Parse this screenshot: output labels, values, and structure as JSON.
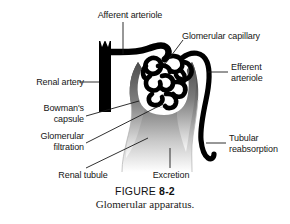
{
  "figure": {
    "number_prefix": "FIGURE",
    "number": "8-2",
    "title": "Glomerular apparatus."
  },
  "labels": {
    "afferent_arteriole": "Afferent arteriole",
    "glomerular_capillary": "Glomerular capillary",
    "efferent_arteriole_line1": "Efferent",
    "efferent_arteriole_line2": "arteriole",
    "renal_artery": "Renal artery",
    "bowmans_capsule_line1": "Bowman's",
    "bowmans_capsule_line2": "capsule",
    "glomerular_filtration_line1": "Glomerular",
    "glomerular_filtration_line2": "filtration",
    "renal_tubule": "Renal tubule",
    "excretion": "Excretion",
    "tubular_reabsorption_line1": "Tubular",
    "tubular_reabsorption_line2": "reabsorption"
  },
  "colors": {
    "ink": "#000000",
    "leader_line": "#1a1a1a",
    "capsule_dark": "#4a4a4a",
    "capsule_mid": "#8d8d8d",
    "capsule_light": "#ffffff",
    "background": "#ffffff"
  }
}
